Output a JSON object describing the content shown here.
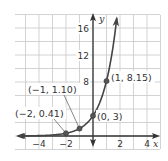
{
  "chart_data": {
    "type": "line",
    "title": "",
    "xlabel": "x",
    "ylabel": "y",
    "function": "y = 3e^x",
    "xlim": [
      -5.5,
      5
    ],
    "ylim": [
      -1.8,
      18
    ],
    "x_grid_step": 1,
    "y_grid_step": 2,
    "grid": true,
    "x_ticks": [
      {
        "value": -4,
        "label": "−4"
      },
      {
        "value": -2,
        "label": "−2"
      },
      {
        "value": 2,
        "label": "2"
      },
      {
        "value": 4,
        "label": "4"
      }
    ],
    "y_ticks": [
      {
        "value": 8,
        "label": "8"
      },
      {
        "value": 12,
        "label": "12"
      },
      {
        "value": 16,
        "label": "16"
      }
    ],
    "series": [
      {
        "name": "y = 3e^x",
        "color": "#444444",
        "x_range": [
          -5.5,
          1.76
        ]
      }
    ],
    "points": [
      {
        "x": -2,
        "y": 0.41,
        "label": "(−2, 0.41)"
      },
      {
        "x": -1,
        "y": 1.1,
        "label": "(−1, 1.10)"
      },
      {
        "x": 0,
        "y": 3,
        "label": "(0, 3)"
      },
      {
        "x": 1,
        "y": 8.15,
        "label": "(1, 8.15)"
      }
    ]
  }
}
